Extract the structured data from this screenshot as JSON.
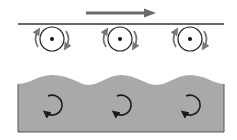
{
  "diagram": {
    "colors": {
      "background": "#ffffff",
      "plate_line": "#333333",
      "motion_arrow": "#6a6a6a",
      "roller_outline": "#222222",
      "rotation_arrow": "#777777",
      "fluid_fill": "#a9a9a9",
      "fluid_edge": "#555555",
      "vortex_arrow": "#1a1a1a"
    },
    "motion_arrow": {
      "direction": "right",
      "x1": 86,
      "x2": 156,
      "y": 13
    },
    "plate": {
      "x1": 18,
      "x2": 224,
      "y": 24
    },
    "rollers": [
      {
        "cx": 52,
        "cy": 39,
        "r": 12
      },
      {
        "cx": 120,
        "cy": 39,
        "r": 12
      },
      {
        "cx": 190,
        "cy": 39,
        "r": 12
      }
    ],
    "fluid": {
      "x1": 18,
      "x2": 224,
      "bottom": 132,
      "wave_crests": 3
    },
    "vortices": [
      {
        "cx": 55,
        "cy": 106
      },
      {
        "cx": 124,
        "cy": 106
      },
      {
        "cx": 193,
        "cy": 106
      }
    ]
  }
}
